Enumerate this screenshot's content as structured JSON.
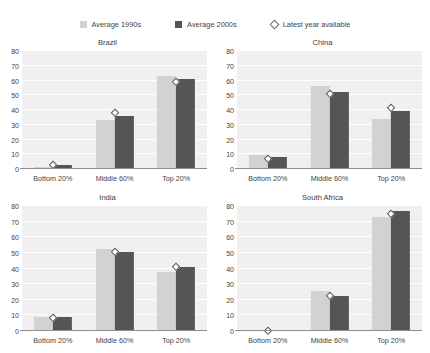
{
  "legend": {
    "items": [
      {
        "label": "Average 1990s",
        "marker": "light-square-swatch",
        "color": "#d2d2d2"
      },
      {
        "label": "Average 2000s",
        "marker": "dark-square-swatch",
        "color": "#555555"
      },
      {
        "label": "Latest year available",
        "marker": "diamond-outline-marker",
        "color": "#ffffff"
      }
    ]
  },
  "chart_data": {
    "type": "bar",
    "title": "",
    "xlabel": "",
    "ylabel": "",
    "ylim": [
      0,
      80
    ],
    "yticks": [
      0,
      10,
      20,
      30,
      40,
      50,
      60,
      70,
      80
    ],
    "grid": true,
    "legend_position": "top-center",
    "categories": [
      "Bottom 20%",
      "Middle 60%",
      "Top 20%"
    ],
    "panels": [
      {
        "title": "Brazil",
        "series": [
          {
            "name": "Average 1990s",
            "values": [
              1.5,
              33.0,
              63.0
            ]
          },
          {
            "name": "Average 2000s",
            "values": [
              2.5,
              36.0,
              61.0
            ]
          },
          {
            "name": "Latest year available",
            "values": [
              3.0,
              38.0,
              59.0
            ]
          }
        ]
      },
      {
        "title": "China",
        "series": [
          {
            "name": "Average 1990s",
            "values": [
              9.5,
              56.0,
              34.0
            ]
          },
          {
            "name": "Average 2000s",
            "values": [
              8.0,
              52.0,
              39.5
            ]
          },
          {
            "name": "Latest year available",
            "values": [
              7.0,
              51.0,
              41.5
            ]
          }
        ]
      },
      {
        "title": "India",
        "series": [
          {
            "name": "Average 1990s",
            "values": [
              9.0,
              52.5,
              38.0
            ]
          },
          {
            "name": "Average 2000s",
            "values": [
              9.0,
              50.5,
              41.0
            ]
          },
          {
            "name": "Latest year available",
            "values": [
              8.5,
              51.0,
              41.5
            ]
          }
        ]
      },
      {
        "title": "South Africa",
        "series": [
          {
            "name": "Average 1990s",
            "values": [
              0.5,
              25.5,
              73.0
            ]
          },
          {
            "name": "Average 2000s",
            "values": [
              0.5,
              22.5,
              76.5
            ]
          },
          {
            "name": "Latest year available",
            "values": [
              0.5,
              23.0,
              75.0
            ]
          }
        ]
      }
    ]
  }
}
